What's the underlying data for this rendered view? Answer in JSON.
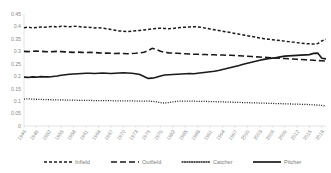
{
  "chart_data": {
    "type": "line",
    "title": "",
    "xlabel": "",
    "ylabel": "",
    "ylim": [
      0,
      0.45
    ],
    "grid": false,
    "legend_position": "bottom",
    "ytick_labels": [
      "0.45",
      "0.4",
      "0.35",
      "0.3",
      "0.25",
      "0.2",
      "0.15",
      "0.1",
      "0.05",
      "0"
    ],
    "ytick_values": [
      0.45,
      0.4,
      0.35,
      0.3,
      0.25,
      0.2,
      0.15,
      0.1,
      0.05,
      0
    ],
    "xtick_labels": [
      "1946",
      "1949",
      "1952",
      "1955",
      "1958",
      "1961",
      "1964",
      "1967",
      "1970",
      "1973",
      "1976",
      "1979",
      "1982",
      "1985",
      "1988",
      "1991",
      "1994",
      "1997",
      "2000",
      "2003",
      "2006",
      "2009",
      "2012",
      "2015",
      "2018"
    ],
    "x": [
      1946,
      1947,
      1948,
      1949,
      1950,
      1951,
      1952,
      1953,
      1954,
      1955,
      1956,
      1957,
      1958,
      1959,
      1960,
      1961,
      1962,
      1963,
      1964,
      1965,
      1966,
      1967,
      1968,
      1969,
      1970,
      1971,
      1972,
      1973,
      1974,
      1975,
      1976,
      1977,
      1978,
      1979,
      1980,
      1981,
      1982,
      1983,
      1984,
      1985,
      1986,
      1987,
      1988,
      1989,
      1990,
      1991,
      1992,
      1993,
      1994,
      1995,
      1996,
      1997,
      1998,
      1999,
      2000,
      2001,
      2002,
      2003,
      2004,
      2005,
      2006,
      2007,
      2008,
      2009,
      2010,
      2011,
      2012,
      2013,
      2014,
      2015,
      2016,
      2017,
      2018,
      2019
    ],
    "series": [
      {
        "name": "Infield",
        "dash": "3,2",
        "width": 1.5,
        "values": [
          0.395,
          0.397,
          0.394,
          0.396,
          0.398,
          0.397,
          0.399,
          0.4,
          0.398,
          0.401,
          0.4,
          0.399,
          0.401,
          0.4,
          0.398,
          0.397,
          0.396,
          0.394,
          0.395,
          0.393,
          0.391,
          0.388,
          0.385,
          0.382,
          0.381,
          0.379,
          0.381,
          0.383,
          0.384,
          0.386,
          0.388,
          0.39,
          0.392,
          0.393,
          0.392,
          0.391,
          0.392,
          0.394,
          0.396,
          0.397,
          0.398,
          0.399,
          0.398,
          0.396,
          0.393,
          0.39,
          0.387,
          0.384,
          0.381,
          0.378,
          0.375,
          0.372,
          0.369,
          0.366,
          0.363,
          0.36,
          0.357,
          0.354,
          0.351,
          0.349,
          0.347,
          0.345,
          0.343,
          0.341,
          0.339,
          0.337,
          0.335,
          0.333,
          0.331,
          0.33,
          0.329,
          0.331,
          0.342,
          0.348
        ]
      },
      {
        "name": "Outfield",
        "dash": "6,3",
        "width": 1.6,
        "values": [
          0.3,
          0.299,
          0.3,
          0.301,
          0.3,
          0.299,
          0.298,
          0.299,
          0.3,
          0.299,
          0.298,
          0.297,
          0.296,
          0.297,
          0.296,
          0.295,
          0.296,
          0.295,
          0.294,
          0.293,
          0.293,
          0.292,
          0.291,
          0.292,
          0.291,
          0.29,
          0.291,
          0.292,
          0.294,
          0.296,
          0.303,
          0.312,
          0.307,
          0.3,
          0.296,
          0.294,
          0.293,
          0.292,
          0.291,
          0.29,
          0.289,
          0.288,
          0.288,
          0.287,
          0.287,
          0.286,
          0.286,
          0.285,
          0.285,
          0.284,
          0.284,
          0.283,
          0.282,
          0.281,
          0.28,
          0.279,
          0.278,
          0.277,
          0.276,
          0.275,
          0.274,
          0.273,
          0.272,
          0.271,
          0.27,
          0.269,
          0.268,
          0.267,
          0.266,
          0.265,
          0.264,
          0.263,
          0.262,
          0.261
        ]
      },
      {
        "name": "Catcher",
        "dash": "1,1.4",
        "width": 1.3,
        "values": [
          0.108,
          0.109,
          0.108,
          0.107,
          0.107,
          0.106,
          0.106,
          0.105,
          0.105,
          0.105,
          0.104,
          0.104,
          0.104,
          0.103,
          0.103,
          0.103,
          0.103,
          0.102,
          0.102,
          0.102,
          0.102,
          0.102,
          0.101,
          0.101,
          0.101,
          0.101,
          0.101,
          0.1,
          0.1,
          0.1,
          0.1,
          0.099,
          0.097,
          0.094,
          0.092,
          0.094,
          0.097,
          0.099,
          0.1,
          0.1,
          0.1,
          0.1,
          0.099,
          0.099,
          0.099,
          0.098,
          0.098,
          0.097,
          0.097,
          0.096,
          0.096,
          0.095,
          0.095,
          0.094,
          0.094,
          0.093,
          0.093,
          0.092,
          0.092,
          0.091,
          0.091,
          0.09,
          0.09,
          0.089,
          0.089,
          0.088,
          0.088,
          0.087,
          0.087,
          0.086,
          0.085,
          0.084,
          0.083,
          0.08
        ]
      },
      {
        "name": "Pitcher",
        "dash": "",
        "width": 1.7,
        "values": [
          0.196,
          0.195,
          0.197,
          0.196,
          0.198,
          0.197,
          0.197,
          0.199,
          0.201,
          0.204,
          0.206,
          0.208,
          0.209,
          0.21,
          0.211,
          0.212,
          0.212,
          0.211,
          0.212,
          0.213,
          0.212,
          0.211,
          0.212,
          0.213,
          0.214,
          0.213,
          0.212,
          0.21,
          0.207,
          0.199,
          0.191,
          0.192,
          0.196,
          0.201,
          0.205,
          0.206,
          0.207,
          0.208,
          0.209,
          0.21,
          0.211,
          0.21,
          0.212,
          0.214,
          0.216,
          0.218,
          0.22,
          0.223,
          0.227,
          0.231,
          0.235,
          0.239,
          0.243,
          0.248,
          0.252,
          0.256,
          0.26,
          0.264,
          0.268,
          0.271,
          0.273,
          0.275,
          0.278,
          0.281,
          0.282,
          0.283,
          0.284,
          0.285,
          0.286,
          0.287,
          0.292,
          0.293,
          0.272,
          0.27
        ]
      }
    ]
  },
  "legend": {
    "items": [
      {
        "label": "Infield",
        "swatch": "dashed-short"
      },
      {
        "label": "Outfield",
        "swatch": "dashed-long"
      },
      {
        "label": "Catcher",
        "swatch": "dotted"
      },
      {
        "label": "Pitcher",
        "swatch": "solid"
      }
    ]
  },
  "colors": {
    "line": "#1a1a1a",
    "axis": "#d0d0d0",
    "tick_text": "#8a8a8a",
    "legend_text": "#7d7d7d",
    "background": "#ffffff"
  }
}
